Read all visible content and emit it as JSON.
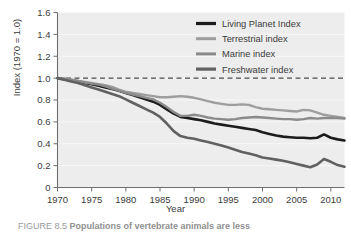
{
  "figure": {
    "caption_prefix": "FIGURE 8.5 ",
    "caption_text": "Populations of vertebrate animals are less"
  },
  "chart_data": {
    "type": "line",
    "title": "",
    "xlabel": "Year",
    "ylabel": "Index (1970 = 1.0)",
    "xlim": [
      1970,
      2012
    ],
    "ylim": [
      0,
      1.6
    ],
    "xticks": [
      1970,
      1975,
      1980,
      1985,
      1990,
      1995,
      2000,
      2005,
      2010
    ],
    "xtick_labels": [
      "1970",
      "1975",
      "1980",
      "1985",
      "1990",
      "1995",
      "2000",
      "2005",
      "2010"
    ],
    "yticks": [
      0,
      0.2,
      0.4,
      0.6,
      0.8,
      1.0,
      1.2,
      1.4,
      1.6
    ],
    "ytick_labels": [
      "0",
      "0.2",
      "0.4",
      "0.6",
      "0.8",
      "1.0",
      "1.2",
      "1.4",
      "1.6"
    ],
    "grid": true,
    "legend_position": "top-right",
    "reference_line": {
      "y": 1.0,
      "style": "dashed",
      "color": "#4a4a4a"
    },
    "plot_background": "#ededed",
    "x": [
      1970,
      1971,
      1972,
      1973,
      1974,
      1975,
      1976,
      1977,
      1978,
      1979,
      1980,
      1981,
      1982,
      1983,
      1984,
      1985,
      1986,
      1987,
      1988,
      1989,
      1990,
      1991,
      1992,
      1993,
      1994,
      1995,
      1996,
      1997,
      1998,
      1999,
      2000,
      2001,
      2002,
      2003,
      2004,
      2005,
      2006,
      2007,
      2008,
      2009,
      2010,
      2011,
      2012
    ],
    "series": [
      {
        "name": "Living Planet Index",
        "color": "#1c1c1c",
        "width": 2.6,
        "values": [
          1.0,
          0.99,
          0.98,
          0.97,
          0.955,
          0.945,
          0.93,
          0.915,
          0.9,
          0.885,
          0.865,
          0.845,
          0.825,
          0.805,
          0.785,
          0.755,
          0.715,
          0.675,
          0.645,
          0.635,
          0.625,
          0.615,
          0.6,
          0.585,
          0.575,
          0.565,
          0.555,
          0.545,
          0.535,
          0.525,
          0.505,
          0.49,
          0.475,
          0.465,
          0.46,
          0.455,
          0.455,
          0.45,
          0.455,
          0.485,
          0.455,
          0.44,
          0.43
        ]
      },
      {
        "name": "Terrestrial index",
        "color": "#9e9e9e",
        "width": 2.4,
        "values": [
          1.0,
          0.995,
          0.985,
          0.975,
          0.965,
          0.955,
          0.945,
          0.935,
          0.92,
          0.895,
          0.875,
          0.865,
          0.855,
          0.845,
          0.835,
          0.825,
          0.825,
          0.83,
          0.835,
          0.83,
          0.82,
          0.805,
          0.79,
          0.775,
          0.765,
          0.755,
          0.755,
          0.76,
          0.755,
          0.735,
          0.72,
          0.715,
          0.71,
          0.705,
          0.7,
          0.695,
          0.71,
          0.705,
          0.685,
          0.665,
          0.655,
          0.645,
          0.635
        ]
      },
      {
        "name": "Marine index",
        "color": "#8a8a8a",
        "width": 2.4,
        "values": [
          1.0,
          0.995,
          0.985,
          0.975,
          0.96,
          0.95,
          0.94,
          0.925,
          0.905,
          0.885,
          0.865,
          0.85,
          0.835,
          0.82,
          0.805,
          0.775,
          0.735,
          0.69,
          0.655,
          0.655,
          0.665,
          0.655,
          0.64,
          0.63,
          0.625,
          0.62,
          0.625,
          0.635,
          0.64,
          0.645,
          0.64,
          0.635,
          0.63,
          0.625,
          0.625,
          0.62,
          0.625,
          0.635,
          0.63,
          0.635,
          0.635,
          0.635,
          0.63
        ]
      },
      {
        "name": "Freshwater index",
        "color": "#616161",
        "width": 2.6,
        "values": [
          1.0,
          0.985,
          0.97,
          0.955,
          0.935,
          0.915,
          0.895,
          0.875,
          0.855,
          0.835,
          0.805,
          0.775,
          0.745,
          0.715,
          0.685,
          0.645,
          0.585,
          0.515,
          0.47,
          0.455,
          0.445,
          0.43,
          0.415,
          0.4,
          0.385,
          0.365,
          0.345,
          0.325,
          0.31,
          0.295,
          0.275,
          0.265,
          0.255,
          0.245,
          0.23,
          0.215,
          0.2,
          0.185,
          0.21,
          0.26,
          0.235,
          0.205,
          0.19
        ]
      }
    ]
  }
}
